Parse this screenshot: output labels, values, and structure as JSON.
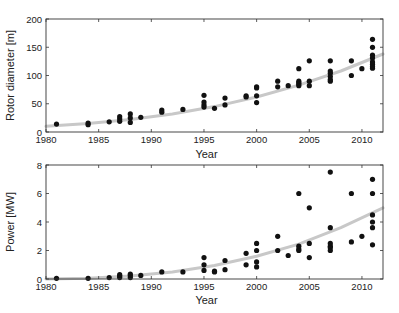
{
  "chart_data": [
    {
      "type": "scatter",
      "title": "",
      "xlabel": "Year",
      "ylabel": "Rotor diameter [m]",
      "xlim": [
        1980,
        2012
      ],
      "ylim": [
        0,
        200
      ],
      "xticks": [
        1980,
        1985,
        1990,
        1995,
        2000,
        2005,
        2010
      ],
      "yticks": [
        0,
        50,
        100,
        150,
        200
      ],
      "grid": false,
      "legend": null,
      "points": [
        [
          1981,
          14
        ],
        [
          1984,
          16
        ],
        [
          1984,
          13
        ],
        [
          1986,
          18
        ],
        [
          1987,
          27
        ],
        [
          1987,
          23
        ],
        [
          1987,
          19
        ],
        [
          1988,
          32
        ],
        [
          1988,
          25
        ],
        [
          1988,
          17
        ],
        [
          1989,
          26
        ],
        [
          1991,
          39
        ],
        [
          1991,
          35
        ],
        [
          1993,
          40
        ],
        [
          1995,
          65
        ],
        [
          1995,
          53
        ],
        [
          1995,
          48
        ],
        [
          1995,
          44
        ],
        [
          1996,
          42
        ],
        [
          1997,
          60
        ],
        [
          1997,
          48
        ],
        [
          1999,
          64
        ],
        [
          1999,
          62
        ],
        [
          2000,
          80
        ],
        [
          2000,
          78
        ],
        [
          2000,
          64
        ],
        [
          2000,
          52
        ],
        [
          2002,
          90
        ],
        [
          2002,
          80
        ],
        [
          2003,
          82
        ],
        [
          2004,
          112
        ],
        [
          2004,
          90
        ],
        [
          2004,
          87
        ],
        [
          2004,
          85
        ],
        [
          2004,
          82
        ],
        [
          2005,
          126
        ],
        [
          2005,
          90
        ],
        [
          2005,
          82
        ],
        [
          2007,
          126
        ],
        [
          2007,
          108
        ],
        [
          2007,
          104
        ],
        [
          2007,
          98
        ],
        [
          2007,
          93
        ],
        [
          2007,
          90
        ],
        [
          2009,
          126
        ],
        [
          2009,
          100
        ],
        [
          2010,
          112
        ],
        [
          2011,
          164
        ],
        [
          2011,
          150
        ],
        [
          2011,
          136
        ],
        [
          2011,
          131
        ],
        [
          2011,
          124
        ],
        [
          2011,
          120
        ],
        [
          2011,
          116
        ],
        [
          2011,
          113
        ]
      ],
      "trend": [
        [
          1980,
          10
        ],
        [
          1984,
          15
        ],
        [
          1988,
          22
        ],
        [
          1992,
          32
        ],
        [
          1996,
          45
        ],
        [
          2000,
          62
        ],
        [
          2004,
          83
        ],
        [
          2008,
          108
        ],
        [
          2012,
          138
        ]
      ],
      "point_color": "#111111",
      "trend_color": "#c8c8c8"
    },
    {
      "type": "scatter",
      "title": "",
      "xlabel": "Year",
      "ylabel": "Power [MW]",
      "xlim": [
        1980,
        2012
      ],
      "ylim": [
        0,
        8
      ],
      "xticks": [
        1980,
        1985,
        1990,
        1995,
        2000,
        2005,
        2010
      ],
      "yticks": [
        0,
        2,
        4,
        6,
        8
      ],
      "grid": false,
      "legend": null,
      "points": [
        [
          1981,
          0.05
        ],
        [
          1984,
          0.05
        ],
        [
          1986,
          0.1
        ],
        [
          1987,
          0.3
        ],
        [
          1987,
          0.2
        ],
        [
          1987,
          0.1
        ],
        [
          1988,
          0.35
        ],
        [
          1988,
          0.25
        ],
        [
          1988,
          0.1
        ],
        [
          1989,
          0.25
        ],
        [
          1991,
          0.5
        ],
        [
          1993,
          0.5
        ],
        [
          1995,
          1.5
        ],
        [
          1995,
          1.0
        ],
        [
          1995,
          0.6
        ],
        [
          1996,
          0.55
        ],
        [
          1996,
          0.5
        ],
        [
          1997,
          1.3
        ],
        [
          1997,
          0.65
        ],
        [
          1999,
          1.8
        ],
        [
          1999,
          1.0
        ],
        [
          2000,
          2.5
        ],
        [
          2000,
          2.0
        ],
        [
          2000,
          1.2
        ],
        [
          2000,
          0.85
        ],
        [
          2002,
          3.0
        ],
        [
          2002,
          2.0
        ],
        [
          2003,
          1.65
        ],
        [
          2004,
          6.0
        ],
        [
          2004,
          2.3
        ],
        [
          2004,
          2.1
        ],
        [
          2004,
          2.0
        ],
        [
          2005,
          5.0
        ],
        [
          2005,
          2.5
        ],
        [
          2005,
          1.5
        ],
        [
          2007,
          7.5
        ],
        [
          2007,
          3.6
        ],
        [
          2007,
          2.5
        ],
        [
          2007,
          2.3
        ],
        [
          2007,
          2.2
        ],
        [
          2007,
          2.0
        ],
        [
          2009,
          6.0
        ],
        [
          2009,
          2.6
        ],
        [
          2010,
          3.0
        ],
        [
          2011,
          7.0
        ],
        [
          2011,
          6.0
        ],
        [
          2011,
          4.5
        ],
        [
          2011,
          4.0
        ],
        [
          2011,
          3.6
        ],
        [
          2011,
          2.4
        ]
      ],
      "trend": [
        [
          1980,
          0.0
        ],
        [
          1984,
          0.05
        ],
        [
          1988,
          0.2
        ],
        [
          1992,
          0.5
        ],
        [
          1996,
          0.95
        ],
        [
          2000,
          1.6
        ],
        [
          2004,
          2.45
        ],
        [
          2008,
          3.6
        ],
        [
          2012,
          5.0
        ]
      ],
      "point_color": "#111111",
      "trend_color": "#c8c8c8"
    }
  ],
  "panels": [
    {
      "ylabel": "Rotor diameter [m]",
      "xlabel": "Year"
    },
    {
      "ylabel": "Power [MW]",
      "xlabel": "Year"
    }
  ]
}
